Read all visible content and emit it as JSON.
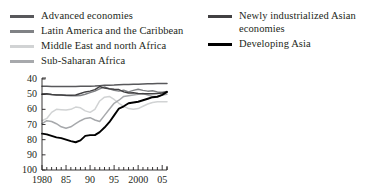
{
  "figure": {
    "title_remnant": "",
    "background": "#ffffff"
  },
  "legend": {
    "left_column": [
      {
        "label": "Advanced economies",
        "color": "#58585b",
        "width": 2.6,
        "icon": "line-swatch-icon"
      },
      {
        "label": "Latin America and the Caribbean",
        "color": "#808285",
        "width": 2.6,
        "icon": "line-swatch-icon"
      },
      {
        "label": "Middle East and north Africa",
        "color": "#d1d3d4",
        "width": 2.6,
        "icon": "line-swatch-icon"
      },
      {
        "label": "Sub-Saharan Africa",
        "color": "#a7a9ac",
        "width": 2.6,
        "icon": "line-swatch-icon"
      }
    ],
    "right_column": [
      {
        "label": "Newly industrialized Asian economies",
        "color": "#414042",
        "width": 2.8,
        "icon": "line-swatch-icon"
      },
      {
        "label": "Developing Asia",
        "color": "#000000",
        "width": 3.2,
        "icon": "line-swatch-icon"
      }
    ]
  },
  "axes": {
    "y_ticks": [
      "100",
      "90",
      "80",
      "70",
      "60",
      "50",
      "40"
    ],
    "x_ticks": [
      "1980",
      "85",
      "90",
      "95",
      "2000",
      "05"
    ],
    "x_tick_years": [
      1980,
      1985,
      1990,
      1995,
      2000,
      2005
    ]
  },
  "chart_data": {
    "type": "line",
    "title": "",
    "subtitle": "",
    "xlabel": "",
    "ylabel": "",
    "xlim": [
      1980,
      2006
    ],
    "ylim": [
      40,
      100
    ],
    "y_ticks": [
      40,
      50,
      60,
      70,
      80,
      90,
      100
    ],
    "x_ticks": [
      1980,
      1985,
      1990,
      1995,
      2000,
      2005
    ],
    "x_minor_tick_step": 1,
    "grid": false,
    "legend_position": "above-plot-two-columns",
    "x": [
      1980,
      1981,
      1982,
      1983,
      1984,
      1985,
      1986,
      1987,
      1988,
      1989,
      1990,
      1991,
      1992,
      1993,
      1994,
      1995,
      1996,
      1997,
      1998,
      1999,
      2000,
      2001,
      2002,
      2003,
      2004,
      2005,
      2006
    ],
    "series": [
      {
        "name": "Advanced economies",
        "color": "#58585b",
        "values": [
          95.2,
          95.2,
          95.1,
          95.1,
          95.0,
          95.0,
          95.0,
          95.1,
          95.2,
          95.2,
          95.3,
          95.4,
          95.6,
          95.8,
          95.9,
          96.0,
          96.2,
          96.3,
          96.4,
          96.5,
          96.6,
          96.7,
          96.8,
          96.9,
          97.0,
          97.0,
          97.0
        ]
      },
      {
        "name": "Latin America and the Caribbean",
        "color": "#808285",
        "values": [
          90.0,
          89.9,
          89.7,
          89.6,
          89.5,
          89.2,
          89.0,
          89.0,
          89.1,
          90.0,
          91.0,
          92.0,
          93.5,
          94.8,
          93.5,
          92.5,
          92.0,
          92.6,
          91.5,
          92.5,
          93.3,
          92.5,
          92.0,
          92.2,
          91.5,
          91.2,
          91.8
        ]
      },
      {
        "name": "Middle East and north Africa",
        "color": "#d1d3d4",
        "values": [
          72.5,
          74.0,
          78.0,
          80.0,
          79.8,
          79.5,
          80.0,
          81.5,
          81.0,
          79.0,
          78.0,
          80.0,
          85.5,
          88.0,
          88.5,
          86.5,
          84.0,
          82.0,
          80.5,
          80.0,
          80.5,
          82.0,
          83.5,
          84.5,
          85.0,
          85.0,
          85.0
        ]
      },
      {
        "name": "Sub-Saharan Africa",
        "color": "#a7a9ac",
        "values": [
          70.5,
          72.5,
          72.0,
          70.5,
          68.5,
          67.5,
          68.5,
          70.5,
          72.5,
          74.0,
          74.5,
          73.0,
          72.0,
          76.0,
          80.0,
          84.0,
          86.0,
          88.5,
          89.0,
          89.5,
          90.0,
          90.5,
          89.5,
          88.5,
          88.5,
          89.5,
          90.0
        ]
      },
      {
        "name": "Newly industrialized Asian economies",
        "color": "#414042",
        "values": [
          90.0,
          90.2,
          89.8,
          89.5,
          89.5,
          89.3,
          89.3,
          89.5,
          90.5,
          91.5,
          92.0,
          93.0,
          95.0,
          94.0,
          93.5,
          93.2,
          93.0,
          91.5,
          90.8,
          91.0,
          90.5,
          90.3,
          90.3,
          90.2,
          90.5,
          90.8,
          91.5
        ]
      },
      {
        "name": "Developing Asia",
        "color": "#000000",
        "values": [
          64.0,
          63.5,
          62.5,
          61.5,
          61.0,
          60.0,
          59.0,
          58.3,
          59.5,
          62.5,
          63.0,
          63.0,
          65.0,
          68.0,
          71.5,
          76.0,
          80.5,
          82.0,
          84.0,
          84.5,
          85.0,
          86.0,
          87.0,
          88.0,
          88.3,
          89.5,
          91.5
        ]
      }
    ]
  }
}
